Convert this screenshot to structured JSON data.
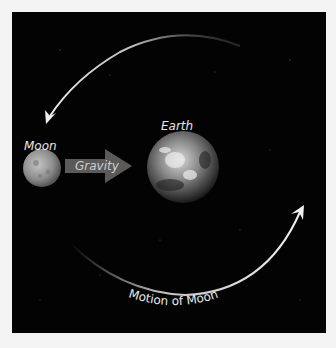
{
  "diagram": {
    "labels": {
      "earth": "Earth",
      "moon": "Moon",
      "gravity": "Gravity",
      "motion": "Motion of Moon"
    },
    "colors": {
      "background": "#030303",
      "border": "#f4f4f4",
      "arrow": "#f0f0f0",
      "gravity_arrow": "#5a5a5a",
      "text": "#e8e8e8"
    },
    "elements": [
      {
        "name": "Earth",
        "type": "planet",
        "cx": 183,
        "cy": 167,
        "r": 36
      },
      {
        "name": "Moon",
        "type": "moon",
        "cx": 42,
        "cy": 168,
        "r": 19
      },
      {
        "name": "Gravity",
        "type": "arrow",
        "from": "Moon",
        "to": "Earth"
      },
      {
        "name": "Motion of Moon",
        "type": "curved-arrow",
        "direction": "counterclockwise"
      }
    ]
  }
}
